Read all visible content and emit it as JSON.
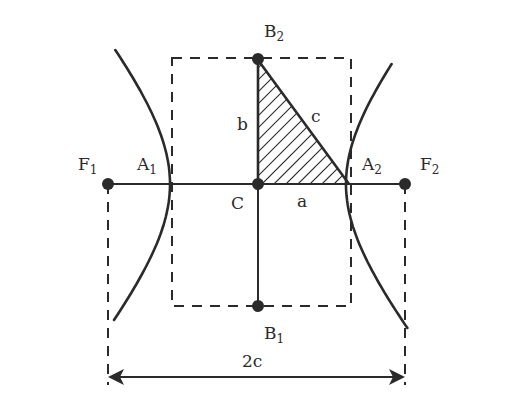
{
  "diagram": {
    "labels": {
      "F1": {
        "main": "F",
        "sub": "1"
      },
      "F2": {
        "main": "F",
        "sub": "2"
      },
      "A1": {
        "main": "A",
        "sub": "1"
      },
      "A2": {
        "main": "A",
        "sub": "2"
      },
      "B1": {
        "main": "B",
        "sub": "1"
      },
      "B2": {
        "main": "B",
        "sub": "2"
      },
      "C": "C",
      "a": "a",
      "b": "b",
      "c": "c",
      "two_c": "2c"
    },
    "geometry_units": {
      "a": 1,
      "b": 1.45,
      "c": 1.76
    },
    "colors": {
      "ink": "#2a2a2a",
      "background": "#ffffff"
    }
  }
}
